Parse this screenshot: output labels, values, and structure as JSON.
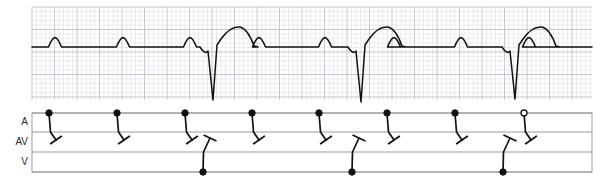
{
  "figure": {
    "type": "ecg-with-ladder-diagram",
    "title": "",
    "background_color": "#ffffff",
    "trace_color": "#111111",
    "grid_minor_color": "#d9d9e0",
    "grid_major_color": "#b9b9c4",
    "ladder_line_color": "#9a9a9a"
  },
  "ecg_panel": {
    "x": 32,
    "y": 7,
    "width": 560,
    "height": 93,
    "baseline_y": 47,
    "grid_minor_px": 4.5,
    "grid_major_px": 22.5
  },
  "ladder_panel": {
    "x": 32,
    "y": 113,
    "width": 560,
    "height": 59,
    "rows": [
      {
        "label": "A",
        "top": 113,
        "bottom": 132,
        "label_y": 122
      },
      {
        "label": "AV",
        "top": 132,
        "bottom": 152,
        "label_y": 142
      },
      {
        "label": "V",
        "top": 152,
        "bottom": 172,
        "label_y": 162
      }
    ],
    "label_x": 28
  },
  "chart_data": {
    "type": "line",
    "xlabel": "",
    "ylabel": "",
    "grid": true,
    "legend": null,
    "series": [
      {
        "name": "ECG lead",
        "baseline": 47,
        "p_waves": [
          {
            "x": 55,
            "peak_y": 38,
            "width": 13
          },
          {
            "x": 123,
            "peak_y": 38,
            "width": 13
          },
          {
            "x": 190,
            "peak_y": 38,
            "width": 13
          },
          {
            "x": 259,
            "peak_y": 38,
            "width": 13
          },
          {
            "x": 325,
            "peak_y": 38,
            "width": 13
          },
          {
            "x": 394,
            "peak_y": 38,
            "width": 13
          },
          {
            "x": 461,
            "peak_y": 38,
            "width": 13
          },
          {
            "x": 529,
            "peak_y": 38,
            "width": 13
          }
        ],
        "qrs_complexes": [
          {
            "x": 212,
            "nadir_y": 100,
            "t_peak_x": 240,
            "t_peak_y": 27
          },
          {
            "x": 360,
            "nadir_y": 102,
            "t_peak_x": 388,
            "t_peak_y": 27
          },
          {
            "x": 514,
            "nadir_y": 99,
            "t_peak_x": 542,
            "t_peak_y": 27
          }
        ]
      }
    ],
    "ladder_events": {
      "atrial": [
        {
          "x": 49,
          "node": "filled",
          "conducts_to": "av-block"
        },
        {
          "x": 117,
          "node": "filled",
          "conducts_to": "av-block"
        },
        {
          "x": 185,
          "node": "filled",
          "conducts_to": "av-block"
        },
        {
          "x": 252,
          "node": "filled",
          "conducts_to": "av-block"
        },
        {
          "x": 319,
          "node": "filled",
          "conducts_to": "av-block"
        },
        {
          "x": 387,
          "node": "filled",
          "conducts_to": "av-block"
        },
        {
          "x": 455,
          "node": "filled",
          "conducts_to": "av-block"
        },
        {
          "x": 524,
          "node": "open",
          "conducts_to": "av-block"
        }
      ],
      "ventricular": [
        {
          "x": 203,
          "node": "filled",
          "conducts_to": "av-retrograde-block"
        },
        {
          "x": 352,
          "node": "filled",
          "conducts_to": "av-retrograde-block"
        },
        {
          "x": 503,
          "node": "filled",
          "conducts_to": "av-retrograde-block"
        }
      ]
    },
    "interpretation": "Complete AV dissociation: every atrial impulse blocks in the AV node and every ventricular escape beat blocks retrogradely."
  }
}
